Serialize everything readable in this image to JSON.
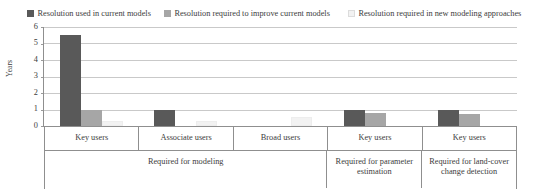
{
  "chart_data": {
    "type": "bar",
    "title": "",
    "xlabel": "",
    "ylabel": "Years",
    "ylim": [
      0,
      6
    ],
    "yticks": [
      "0",
      "1",
      "2",
      "3",
      "4",
      "5",
      "6"
    ],
    "grid": true,
    "legend_position": "top",
    "categories": [
      "Key users",
      "Associate users",
      "Broad users",
      "Key users",
      "Key users"
    ],
    "group_labels": [
      "Required for modeling",
      "Required for parameter estimation",
      "Required for land-cover change detection"
    ],
    "group_spans": [
      3,
      1,
      1
    ],
    "series": [
      {
        "name": "Resolution used in current models",
        "color": "#595959",
        "values": [
          5.5,
          1.0,
          0,
          1.0,
          1.0
        ]
      },
      {
        "name": "Resolution required to improve current models",
        "color": "#a6a6a6",
        "values": [
          1.0,
          0,
          0,
          0.8,
          0.75
        ]
      },
      {
        "name": "Resolution required in new modeling approaches",
        "color": "#f2f2f2",
        "values": [
          0.3,
          0.3,
          0.55,
          0,
          0
        ]
      }
    ]
  },
  "legend": {
    "items": [
      {
        "label": "Resolution used in current models",
        "color": "#595959"
      },
      {
        "label": "Resolution required to improve current models",
        "color": "#a6a6a6"
      },
      {
        "label": "Resolution required in new modeling approaches",
        "color": "#f2f2f2"
      }
    ]
  },
  "axis": {
    "y_title": "Years",
    "y_ticks": [
      "6",
      "5",
      "4",
      "3",
      "2",
      "1",
      "0"
    ]
  },
  "xaxis": {
    "tier1": [
      "Key users",
      "Associate users",
      "Broad users",
      "Key users",
      "Key users"
    ],
    "tier2": [
      "Required for modeling",
      "Required for parameter estimation",
      "Required for land-cover change detection"
    ]
  }
}
